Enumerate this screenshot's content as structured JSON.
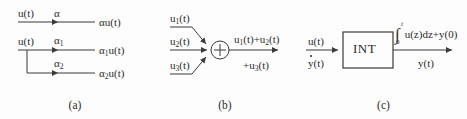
{
  "figure": {
    "background": "#fdfdfd",
    "line_color": "#3a3a3a",
    "text_color": "#2b2b2b"
  },
  "panels": [
    {
      "id": "a",
      "caption": "(a)",
      "rows": [
        {
          "input": "u(t)",
          "gain": "α",
          "output_base": "αu(t)",
          "output_sub": ""
        },
        {
          "input": "u(t)",
          "gain_base": "α",
          "gain_sub": "1",
          "output_base": "α",
          "output_sub": "1",
          "output_tail": "u(t)"
        },
        {
          "gain_base": "α",
          "gain_sub": "2",
          "output_base": "α",
          "output_sub": "2",
          "output_tail": "u(t)"
        }
      ]
    },
    {
      "id": "b",
      "caption": "(b)",
      "summer_symbol": "+",
      "inputs": [
        {
          "base": "u",
          "sub": "1",
          "tail": "(t)"
        },
        {
          "base": "u",
          "sub": "2",
          "tail": "(t)"
        },
        {
          "base": "u",
          "sub": "3",
          "tail": "(t)"
        }
      ],
      "output_line1": {
        "a_base": "u",
        "a_sub": "1",
        "a_tail": "(t)+",
        "b_base": "u",
        "b_sub": "2",
        "b_tail": "(t)"
      },
      "output_line2": {
        "prefix": "+",
        "base": "u",
        "sub": "3",
        "tail": "(t)"
      }
    },
    {
      "id": "c",
      "caption": "(c)",
      "block_label": "INT",
      "input_top": "u(t)",
      "input_bottom_base": "y",
      "input_bottom_tail": "(t)",
      "output_top": {
        "integral_lower": "0",
        "integral_upper": "t",
        "integrand": "u(z)dz+y(0)"
      },
      "output_bottom": "y(t)"
    }
  ]
}
